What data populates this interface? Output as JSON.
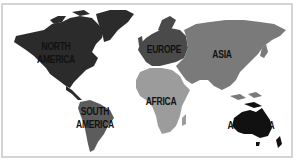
{
  "map": {
    "type": "world-continents",
    "style": "grayscale",
    "regions": [
      {
        "id": "north-america",
        "label_lines": [
          "NORTH",
          "AMERICA"
        ],
        "color": "#2b2b2b"
      },
      {
        "id": "south-america",
        "label_lines": [
          "SOUTH",
          "AMERICA"
        ],
        "color": "#5c5c5c"
      },
      {
        "id": "europe",
        "label_lines": [
          "EUROPE"
        ],
        "color": "#4a4a4a"
      },
      {
        "id": "asia",
        "label_lines": [
          "ASIA"
        ],
        "color": "#7a7a7a"
      },
      {
        "id": "africa",
        "label_lines": [
          "AFRICA"
        ],
        "color": "#9c9c9c"
      },
      {
        "id": "australia",
        "label_lines": [
          "AUSTRALIA"
        ],
        "color": "#111111"
      }
    ],
    "border_color": "#d4d4d4",
    "background": "#ffffff"
  }
}
